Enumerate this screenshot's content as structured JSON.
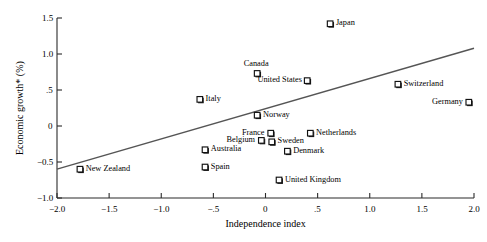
{
  "chart_data": {
    "type": "scatter",
    "title": "",
    "xlabel": "Independence index",
    "ylabel": "Economic growth* (%)",
    "xlim": [
      -2.0,
      2.0
    ],
    "ylim": [
      -1.0,
      1.5
    ],
    "xticks": [
      -2.0,
      -1.5,
      -1.0,
      -0.5,
      0,
      0.5,
      1.0,
      1.5,
      2.0
    ],
    "xticklabels": [
      "−2.0",
      "−1.5",
      "−1.0",
      "−.5",
      "0",
      ".5",
      "1.0",
      "1.5",
      "2.0"
    ],
    "yticks": [
      -1.0,
      -0.5,
      0,
      0.5,
      1.0,
      1.5
    ],
    "yticklabels": [
      "−1.0",
      "−0.5",
      "0",
      ".5",
      "1.0",
      "1.5"
    ],
    "grid": false,
    "legend": null,
    "marker": "open-square",
    "trendline": {
      "type": "line",
      "x": [
        -2.0,
        2.0
      ],
      "y": [
        -0.6,
        1.08
      ],
      "slope": 0.42,
      "intercept": 0.24
    },
    "points": [
      {
        "label": "Japan",
        "x": 0.62,
        "y": 1.42,
        "label_side": "right"
      },
      {
        "label": "Canada",
        "x": -0.08,
        "y": 0.73,
        "label_side": "above"
      },
      {
        "label": "United States",
        "x": 0.4,
        "y": 0.63,
        "label_side": "left"
      },
      {
        "label": "Switzerland",
        "x": 1.27,
        "y": 0.58,
        "label_side": "right"
      },
      {
        "label": "Germany",
        "x": 1.95,
        "y": 0.33,
        "label_side": "left"
      },
      {
        "label": "Italy",
        "x": -0.63,
        "y": 0.37,
        "label_side": "right"
      },
      {
        "label": "Norway",
        "x": -0.08,
        "y": 0.15,
        "label_side": "right"
      },
      {
        "label": "France",
        "x": 0.05,
        "y": -0.1,
        "label_side": "left"
      },
      {
        "label": "Netherlands",
        "x": 0.43,
        "y": -0.1,
        "label_side": "right"
      },
      {
        "label": "Belgium",
        "x": -0.04,
        "y": -0.2,
        "label_side": "left"
      },
      {
        "label": "Sweden",
        "x": 0.06,
        "y": -0.22,
        "label_side": "right"
      },
      {
        "label": "Australia",
        "x": -0.58,
        "y": -0.33,
        "label_side": "right"
      },
      {
        "label": "Denmark",
        "x": 0.21,
        "y": -0.35,
        "label_side": "right"
      },
      {
        "label": "Spain",
        "x": -0.58,
        "y": -0.57,
        "label_side": "right"
      },
      {
        "label": "New Zealand",
        "x": -1.78,
        "y": -0.6,
        "label_side": "right"
      },
      {
        "label": "United Kingdom",
        "x": 0.13,
        "y": -0.75,
        "label_side": "right"
      }
    ]
  },
  "axis_titles": {
    "x": "Independence index",
    "y": "Economic growth* (%)"
  }
}
